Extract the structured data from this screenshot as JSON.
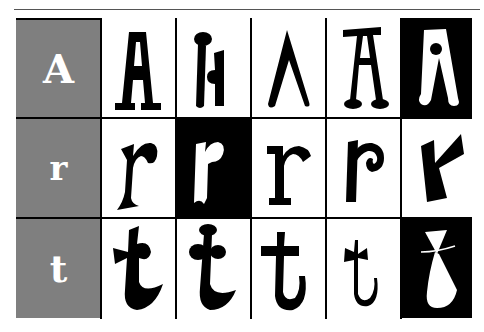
{
  "rows": [
    {
      "label": "A",
      "label_size": 40,
      "variants": [
        "A-slab-serif",
        "A-ball-terminal-split",
        "A-lambda-no-crossbar",
        "A-ball-feet",
        "A-inverted-dot"
      ]
    },
    {
      "label": "r",
      "label_size": 36,
      "variants": [
        "r-flared",
        "r-inverted-ribbon",
        "r-slab-serif",
        "r-spiral",
        "r-angular"
      ]
    },
    {
      "label": "t",
      "label_size": 38,
      "variants": [
        "t-bowtie",
        "t-ball-top",
        "t-slab",
        "t-thin-curl",
        "t-inverted-cone"
      ]
    }
  ],
  "colors": {
    "label_bg": "#7f7f7f",
    "label_text": "#ffffff",
    "ink": "#000000",
    "paper": "#ffffff"
  },
  "inverted_cells": [
    [
      0,
      4
    ],
    [
      1,
      1
    ],
    [
      2,
      4
    ]
  ]
}
